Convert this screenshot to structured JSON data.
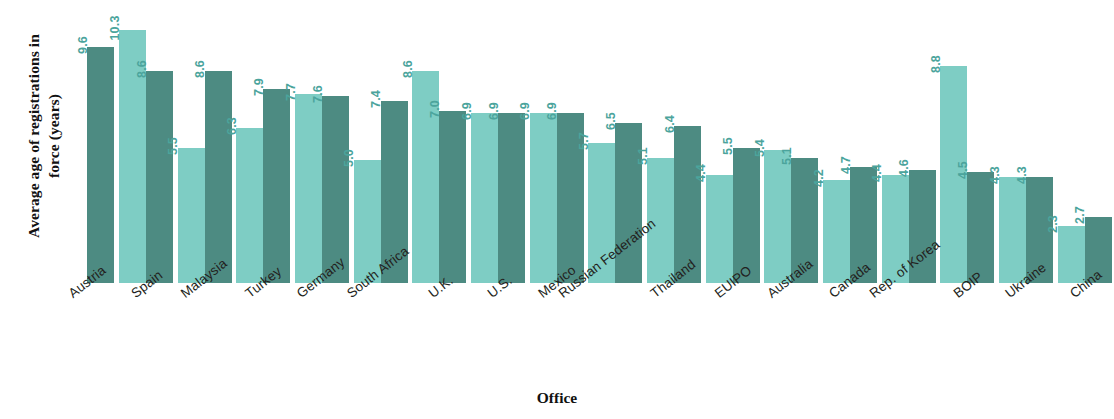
{
  "chart_data": {
    "type": "bar",
    "title": "",
    "xlabel": "Office",
    "ylabel": "Average age of registrations in\nforce (years)",
    "ylim": [
      0,
      11.5
    ],
    "grid": false,
    "legend": "none",
    "axis_visible": false,
    "categories": [
      "Austria",
      "Spain",
      "Malaysia",
      "Turkey",
      "Germany",
      "South Africa",
      "U.K.",
      "U.S.",
      "Mexico",
      "Russian Federation",
      "Thailand",
      "EUIPO",
      "Australia",
      "Canada",
      "Rep. of Korea",
      "BOIP",
      "Ukraine",
      "China"
    ],
    "series": [
      {
        "name": "series-light",
        "color": "#7ecdc4",
        "values": [
          null,
          10.3,
          5.5,
          6.3,
          7.7,
          5.0,
          8.6,
          6.9,
          6.9,
          5.7,
          5.1,
          4.4,
          5.4,
          4.2,
          4.4,
          8.8,
          4.3,
          2.3
        ]
      },
      {
        "name": "series-dark",
        "color": "#4d8b82",
        "values": [
          9.6,
          8.6,
          8.6,
          7.9,
          7.6,
          7.4,
          7.0,
          6.9,
          6.9,
          6.5,
          6.4,
          5.5,
          5.1,
          4.7,
          4.6,
          4.5,
          4.3,
          2.7
        ]
      }
    ],
    "value_labels": [
      {
        "category": "Austria",
        "light": "",
        "dark": "9.6"
      },
      {
        "category": "Spain",
        "light": "10.3",
        "dark": "8.6"
      },
      {
        "category": "Malaysia",
        "light": "5.5",
        "dark": "8.6"
      },
      {
        "category": "Turkey",
        "light": "6.3",
        "dark": "7.9"
      },
      {
        "category": "Germany",
        "light": "7.7",
        "dark": "7.6"
      },
      {
        "category": "South Africa",
        "light": "5.0",
        "dark": "7.4"
      },
      {
        "category": "U.K.",
        "light": "8.6",
        "dark": "7.0"
      },
      {
        "category": "U.S.",
        "light": "6.9",
        "dark": "6.9"
      },
      {
        "category": "Mexico",
        "light": "6.9",
        "dark": "6.9"
      },
      {
        "category": "Russian Federation",
        "light": "5.7",
        "dark": "6.5"
      },
      {
        "category": "Thailand",
        "light": "5.1",
        "dark": "6.4"
      },
      {
        "category": "EUIPO",
        "light": "4.4",
        "dark": "5.5"
      },
      {
        "category": "Australia",
        "light": "5.4",
        "dark": "5.1"
      },
      {
        "category": "Canada",
        "light": "4.2",
        "dark": "4.7"
      },
      {
        "category": "Rep. of Korea",
        "light": "4.4",
        "dark": "4.6"
      },
      {
        "category": "BOIP",
        "light": "8.8",
        "dark": "4.5"
      },
      {
        "category": "Ukraine",
        "light": "4.3",
        "dark": "4.3"
      },
      {
        "category": "China",
        "light": "2.3",
        "dark": "2.7"
      }
    ]
  },
  "colors": {
    "light_bar": "#7ecdc4",
    "dark_bar": "#4d8b82",
    "value_label": "#4ba49c",
    "axis_text": "#231f20",
    "background": "#ffffff"
  }
}
